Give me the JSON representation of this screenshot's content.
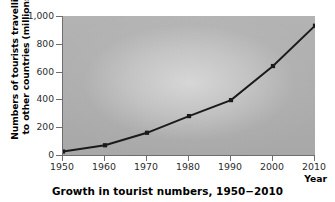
{
  "chart_data": {
    "type": "line",
    "title": "Growth in tourist numbers, 1950−2010",
    "xlabel": "Year",
    "ylabel": "Numbers of tourists travelling to other countries (millions)",
    "ylabel_lines": [
      "Numbers of tourists travelling",
      "to other countries (millions)"
    ],
    "categories": [
      "1950",
      "1960",
      "1970",
      "1980",
      "1990",
      "2000",
      "2010"
    ],
    "x": [
      1950,
      1960,
      1970,
      1980,
      1990,
      2000,
      2010
    ],
    "values": [
      25,
      70,
      160,
      280,
      395,
      640,
      930
    ],
    "xlim": [
      1950,
      2010
    ],
    "ylim": [
      0,
      1000
    ],
    "yticks": [
      0,
      200,
      400,
      600,
      800,
      1000
    ],
    "ytick_labels": [
      "0",
      "200",
      "400",
      "600",
      "800",
      "1,000"
    ],
    "xticks": [
      1950,
      1960,
      1970,
      1980,
      1990,
      2000,
      2010
    ],
    "xtick_labels": [
      "1950",
      "1960",
      "1970",
      "1980",
      "1990",
      "2000",
      "2010"
    ],
    "grid": false,
    "legend": null,
    "marker": "square",
    "series_color": "#1a1a1a",
    "plot_background_color": "#adadad",
    "axis_color": "#6e6e6e",
    "figure_background_color": "#ffffff"
  },
  "axes": {
    "y_title_line1": "Numbers of tourists travelling",
    "y_title_line2": "to other countries (millions)",
    "x_title": "Year"
  },
  "caption": {
    "text": "Growth in tourist numbers, 1950−2010"
  }
}
